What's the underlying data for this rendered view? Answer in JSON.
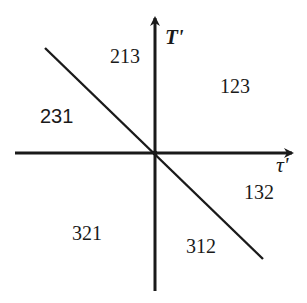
{
  "diagram": {
    "axes": {
      "vertical_label": "T'",
      "horizontal_label": "τ'"
    },
    "regions": [
      {
        "id": "213",
        "label": "213"
      },
      {
        "id": "123",
        "label": "123"
      },
      {
        "id": "231",
        "label": "231"
      },
      {
        "id": "132",
        "label": "132"
      },
      {
        "id": "321",
        "label": "321"
      },
      {
        "id": "312",
        "label": "312"
      }
    ],
    "colors": {
      "ink": "#1a1a1a",
      "background": "#ffffff"
    }
  }
}
